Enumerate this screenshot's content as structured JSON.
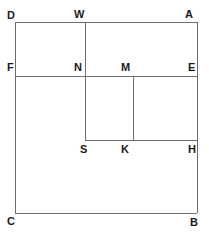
{
  "figure": {
    "stroke_color": "#6e6e6e",
    "label_color": "#1a1a1a",
    "background_color": "#ffffff",
    "stroke_width": 1,
    "width": 209,
    "height": 237,
    "vertices": [
      {
        "id": "D",
        "label": "D",
        "x": 15,
        "y": 22,
        "label_x": 7,
        "label_y": 10
      },
      {
        "id": "W",
        "label": "W",
        "x": 85,
        "y": 22,
        "label_x": 74,
        "label_y": 9
      },
      {
        "id": "A",
        "label": "A",
        "x": 197,
        "y": 22,
        "label_x": 185,
        "label_y": 9
      },
      {
        "id": "F",
        "label": "F",
        "x": 15,
        "y": 76,
        "label_x": 7,
        "label_y": 62
      },
      {
        "id": "N",
        "label": "N",
        "x": 85,
        "y": 76,
        "label_x": 74,
        "label_y": 62
      },
      {
        "id": "M",
        "label": "M",
        "x": 133,
        "y": 76,
        "label_x": 121,
        "label_y": 62
      },
      {
        "id": "E",
        "label": "E",
        "x": 197,
        "y": 76,
        "label_x": 188,
        "label_y": 62
      },
      {
        "id": "S",
        "label": "S",
        "x": 85,
        "y": 140,
        "label_x": 80,
        "label_y": 144
      },
      {
        "id": "K",
        "label": "K",
        "x": 133,
        "y": 140,
        "label_x": 121,
        "label_y": 144
      },
      {
        "id": "H",
        "label": "H",
        "x": 197,
        "y": 140,
        "label_x": 188,
        "label_y": 144
      },
      {
        "id": "C",
        "label": "C",
        "x": 15,
        "y": 213,
        "label_x": 7,
        "label_y": 216
      },
      {
        "id": "B",
        "label": "B",
        "x": 197,
        "y": 213,
        "label_x": 190,
        "label_y": 217
      }
    ],
    "segments": [
      {
        "id": "DA",
        "from": "D",
        "to": "A",
        "x1": 15,
        "y1": 22,
        "x2": 197,
        "y2": 22
      },
      {
        "id": "DC",
        "from": "D",
        "to": "C",
        "x1": 15,
        "y1": 22,
        "x2": 15,
        "y2": 213
      },
      {
        "id": "AB",
        "from": "A",
        "to": "B",
        "x1": 197,
        "y1": 22,
        "x2": 197,
        "y2": 213
      },
      {
        "id": "CB",
        "from": "C",
        "to": "B",
        "x1": 15,
        "y1": 213,
        "x2": 197,
        "y2": 213
      },
      {
        "id": "FE",
        "from": "F",
        "to": "E",
        "x1": 15,
        "y1": 76,
        "x2": 197,
        "y2": 76
      },
      {
        "id": "WS",
        "from": "W",
        "to": "S",
        "x1": 85,
        "y1": 22,
        "x2": 85,
        "y2": 140
      },
      {
        "id": "MK",
        "from": "M",
        "to": "K",
        "x1": 133,
        "y1": 76,
        "x2": 133,
        "y2": 140
      },
      {
        "id": "SH",
        "from": "S",
        "to": "H",
        "x1": 85,
        "y1": 140,
        "x2": 197,
        "y2": 140
      }
    ]
  }
}
